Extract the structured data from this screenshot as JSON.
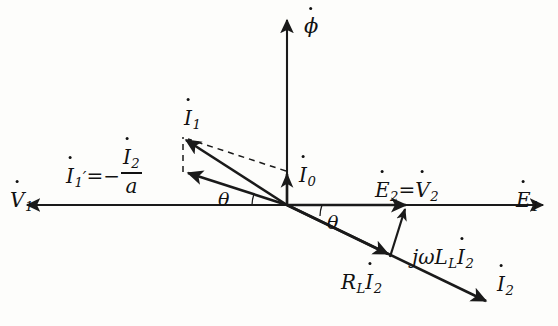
{
  "figure": {
    "type": "phasor-diagram",
    "background_color": "#fdfdfb",
    "line_color": "#1a1a1a"
  },
  "axes": {
    "horizontal": {
      "right_label": "E",
      "right_sub": "1",
      "right_label_full": "Ė1",
      "left_label": "V",
      "left_sub": "1",
      "left_label_full": "V̇1",
      "y": 205,
      "x_start": 25,
      "x_end": 545
    },
    "vertical": {
      "top_label": "ϕ",
      "top_label_full": "ϕ̇",
      "x": 287,
      "y_top": 18,
      "y_bottom": 205
    }
  },
  "origin": {
    "x": 287,
    "y": 205
  },
  "labels": {
    "phi": "ϕ",
    "I1": "I",
    "I1_sub": "1",
    "I0": "I",
    "I0_sub": "0",
    "V1": "V",
    "V1_sub": "1",
    "E1": "E",
    "E1_sub": "1",
    "E2": "E",
    "E2_sub": "2",
    "V2": "V",
    "V2_sub": "2",
    "equals": "=",
    "I1prime": "I",
    "I1prime_sub": "1",
    "prime_mark": "′",
    "minus": "=−",
    "I2_num": "I",
    "I2_num_sub": "2",
    "denominator": "a",
    "theta_left": "θ",
    "theta_right": "θ",
    "jwL_j": "j",
    "jwL_omega": "ω",
    "jwL_L": "L",
    "jwL_L_sub": "L",
    "jwL_I": "I",
    "jwL_I_sub": "2",
    "RL_R": "R",
    "RL_R_sub": "L",
    "RL_I": "I",
    "RL_I_sub": "2",
    "I2": "I",
    "I2_sub": "2"
  },
  "vectors": [
    {
      "name": "phi-axis",
      "label": "ϕ̇",
      "from": [
        287,
        205
      ],
      "to": [
        287,
        18
      ],
      "style": "axis",
      "arrow": true
    },
    {
      "name": "E1-axis",
      "label": "Ė1",
      "from": [
        287,
        205
      ],
      "to": [
        545,
        205
      ],
      "style": "axis",
      "arrow": true
    },
    {
      "name": "V1-axis",
      "label": "V̇1",
      "from": [
        287,
        205
      ],
      "to": [
        25,
        205
      ],
      "style": "axis",
      "arrow": true
    },
    {
      "name": "I1",
      "label": "İ1",
      "from": [
        287,
        205
      ],
      "to": [
        182,
        137
      ],
      "style": "vector",
      "arrow": true
    },
    {
      "name": "I1-prime",
      "label": "İ1′",
      "from": [
        287,
        205
      ],
      "to": [
        183,
        173
      ],
      "style": "vector",
      "arrow": true
    },
    {
      "name": "I0",
      "label": "İ0",
      "from": [
        287,
        205
      ],
      "to": [
        287,
        170
      ],
      "style": "vector",
      "arrow": true
    },
    {
      "name": "I2",
      "label": "İ2",
      "from": [
        287,
        205
      ],
      "to": [
        490,
        303
      ],
      "style": "vector",
      "arrow": true
    },
    {
      "name": "RL-I2",
      "label": "R_L İ2",
      "from": [
        287,
        205
      ],
      "to": [
        390,
        255
      ],
      "style": "vector",
      "arrow": true
    },
    {
      "name": "jwLL-I2",
      "label": "jωL_L İ2",
      "from": [
        390,
        255
      ],
      "to": [
        406,
        205
      ],
      "style": "vector",
      "arrow": true
    },
    {
      "name": "E2-V2",
      "label": "Ė2 = V̇2",
      "from": [
        287,
        205
      ],
      "to": [
        410,
        205
      ],
      "style": "vector",
      "arrow": true
    }
  ],
  "dashed_construction": [
    {
      "name": "I0-to-I1-dashed",
      "from": [
        287,
        172
      ],
      "to": [
        185,
        139
      ]
    },
    {
      "name": "I1prime-vertical-dashed",
      "from": [
        183,
        171
      ],
      "to": [
        183,
        136
      ]
    }
  ],
  "angles": [
    {
      "name": "theta-left",
      "label": "θ",
      "between": [
        "V1-axis",
        "I1-prime"
      ],
      "vertex": [
        287,
        205
      ]
    },
    {
      "name": "theta-right",
      "label": "θ",
      "between": [
        "E1-axis",
        "I2"
      ],
      "vertex": [
        287,
        205
      ]
    }
  ]
}
